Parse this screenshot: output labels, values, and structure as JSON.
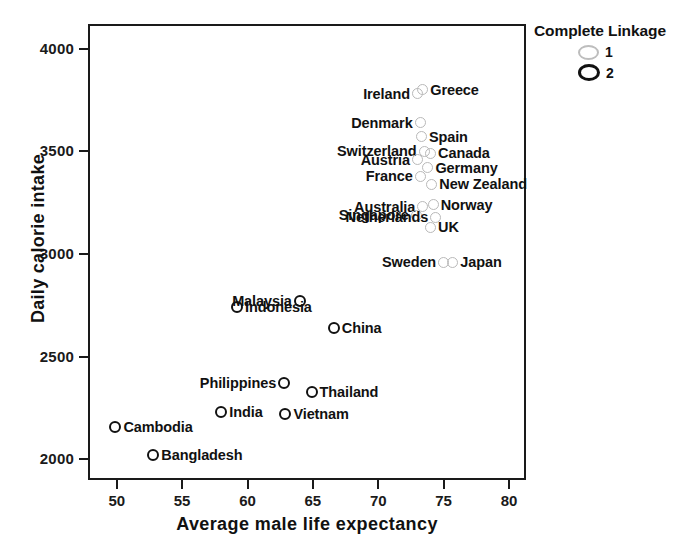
{
  "chart_data": {
    "type": "scatter",
    "title": "",
    "xlabel": "Average male life expectancy",
    "ylabel": "Daily calorie intake",
    "xlim": [
      47.8,
      81.3
    ],
    "ylim": [
      1900,
      4120
    ],
    "xticks": [
      50,
      55,
      60,
      65,
      70,
      75,
      80
    ],
    "xtick_labels": [
      "50",
      "55",
      "60",
      "65",
      "70",
      "75",
      "80"
    ],
    "yticks": [
      2000,
      2500,
      3000,
      3500,
      4000
    ],
    "ytick_labels": [
      "2000",
      "2500",
      "3000",
      "3500",
      "4000"
    ],
    "grid": false,
    "legend": {
      "title": "Complete Linkage",
      "position": "top-right",
      "entries": [
        {
          "label": "1",
          "marker": "open-circle",
          "color": "#bdbdbd"
        },
        {
          "label": "2",
          "marker": "open-circle",
          "color": "#111111"
        }
      ]
    },
    "points": [
      {
        "name": "Ireland",
        "x": 73.0,
        "y": 3780,
        "cluster": 1,
        "label_side": "left"
      },
      {
        "name": "Greece",
        "x": 73.4,
        "y": 3800,
        "cluster": 1,
        "label_side": "right"
      },
      {
        "name": "Denmark",
        "x": 73.2,
        "y": 3640,
        "cluster": 1,
        "label_side": "left"
      },
      {
        "name": "Spain",
        "x": 73.3,
        "y": 3570,
        "cluster": 1,
        "label_side": "right"
      },
      {
        "name": "Switzerland",
        "x": 73.5,
        "y": 3500,
        "cluster": 1,
        "label_side": "left"
      },
      {
        "name": "Canada",
        "x": 74.0,
        "y": 3490,
        "cluster": 1,
        "label_side": "right"
      },
      {
        "name": "Austria",
        "x": 73.0,
        "y": 3460,
        "cluster": 1,
        "label_side": "left"
      },
      {
        "name": "Germany",
        "x": 73.8,
        "y": 3420,
        "cluster": 1,
        "label_side": "right"
      },
      {
        "name": "France",
        "x": 73.2,
        "y": 3380,
        "cluster": 1,
        "label_side": "left"
      },
      {
        "name": "New Zealand",
        "x": 74.1,
        "y": 3340,
        "cluster": 1,
        "label_side": "right"
      },
      {
        "name": "Australia",
        "x": 73.4,
        "y": 3230,
        "cluster": 1,
        "label_side": "left"
      },
      {
        "name": "Norway",
        "x": 74.2,
        "y": 3240,
        "cluster": 1,
        "label_side": "right"
      },
      {
        "name": "Singapore",
        "x": 72.9,
        "y": 3190,
        "cluster": 1,
        "label_side": "left"
      },
      {
        "name": "UK",
        "x": 74.0,
        "y": 3130,
        "cluster": 1,
        "label_side": "right"
      },
      {
        "name": "Netherlands",
        "x": 74.4,
        "y": 3180,
        "cluster": 1,
        "label_side": "left"
      },
      {
        "name": "Sweden",
        "x": 75.0,
        "y": 2960,
        "cluster": 1,
        "label_side": "left"
      },
      {
        "name": "Japan",
        "x": 75.7,
        "y": 2960,
        "cluster": 1,
        "label_side": "right"
      },
      {
        "name": "Malaysia",
        "x": 64.0,
        "y": 2770,
        "cluster": 2,
        "label_side": "left"
      },
      {
        "name": "Indonesia",
        "x": 59.2,
        "y": 2740,
        "cluster": 2,
        "label_side": "right"
      },
      {
        "name": "China",
        "x": 66.6,
        "y": 2640,
        "cluster": 2,
        "label_side": "right"
      },
      {
        "name": "Philippines",
        "x": 62.8,
        "y": 2370,
        "cluster": 2,
        "label_side": "left"
      },
      {
        "name": "Thailand",
        "x": 64.9,
        "y": 2330,
        "cluster": 2,
        "label_side": "right"
      },
      {
        "name": "India",
        "x": 58.0,
        "y": 2230,
        "cluster": 2,
        "label_side": "right"
      },
      {
        "name": "Vietnam",
        "x": 62.9,
        "y": 2220,
        "cluster": 2,
        "label_side": "right"
      },
      {
        "name": "Cambodia",
        "x": 49.9,
        "y": 2160,
        "cluster": 2,
        "label_side": "right"
      },
      {
        "name": "Bangladesh",
        "x": 52.8,
        "y": 2020,
        "cluster": 2,
        "label_side": "right"
      }
    ]
  },
  "axes": {
    "x_title": "Average male life expectancy",
    "y_title": "Daily calorie intake"
  },
  "legend": {
    "title": "Complete Linkage",
    "item1_label": "1",
    "item2_label": "2"
  }
}
